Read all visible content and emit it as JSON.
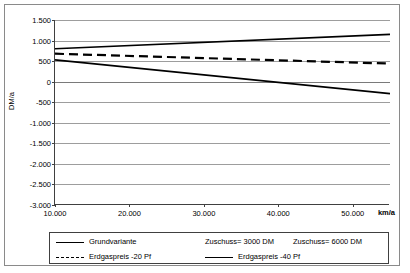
{
  "chart_data": {
    "type": "line",
    "title": "",
    "xlabel": "km/a",
    "ylabel": "DM/a",
    "xlim": [
      10000,
      55000
    ],
    "ylim": [
      -3000,
      1500
    ],
    "grid": true,
    "legend_position": "bottom",
    "x_ticks": [
      "10.000",
      "20.000",
      "30.000",
      "40.000",
      "50.000"
    ],
    "x_tick_values": [
      10000,
      20000,
      30000,
      40000,
      50000
    ],
    "y_ticks": [
      "1.500",
      "1.000",
      "500",
      "0",
      "-500",
      "-1.000",
      "-1.500",
      "-2.000",
      "-2.500",
      "-3.000"
    ],
    "y_tick_values": [
      1500,
      1000,
      500,
      0,
      -500,
      -1000,
      -1500,
      -2000,
      -2500,
      -3000
    ],
    "x": [
      10000,
      55000
    ],
    "series": [
      {
        "name": "Zuschuss= 6000 DM",
        "style": "solid",
        "values": [
          800,
          1150
        ]
      },
      {
        "name": "Erdgaspreis -20 Pf",
        "style": "dashed",
        "values": [
          680,
          440
        ]
      },
      {
        "name": "Erdgaspreis -40 Pf",
        "style": "solid",
        "values": [
          530,
          -290
        ]
      }
    ]
  },
  "axes": {
    "y_axis_label": "DM/a",
    "x_axis_unit": "km/a"
  },
  "legend": {
    "entries": [
      {
        "label": "Grundvariante",
        "style": "solid"
      },
      {
        "label": "Zuschuss= 3000 DM",
        "style": "none"
      },
      {
        "label": "Zuschuss= 6000 DM",
        "style": "none"
      },
      {
        "label": "Erdgaspreis -20 Pf",
        "style": "dashed"
      },
      {
        "label": "Erdgaspreis -40 Pf",
        "style": "solid"
      }
    ]
  },
  "colors": {
    "line": "#000000",
    "grid": "#9d9d9d",
    "axis": "#404040",
    "border": "#8a8a8a",
    "background": "#ffffff"
  }
}
